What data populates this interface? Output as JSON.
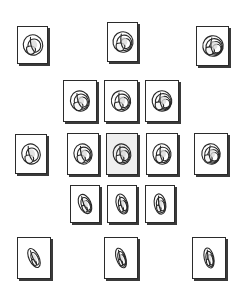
{
  "figure": {
    "type": "shape-matrix",
    "background_color": "#ffffff",
    "card_border_color": "#2b2b2b",
    "card_shadow_color": "#3a3a3a",
    "card_fill_color": "#ffffff",
    "selected_card_fill_color": "#efefef",
    "icon_stroke_color": "#262626",
    "icon_name": "spiral-shell-icon",
    "rows": 5,
    "columns": 5,
    "card_count": 15
  },
  "chart_data": {
    "type": "scatter",
    "xlabel": "",
    "ylabel": "",
    "grid": false,
    "legend": null,
    "cells": [
      {
        "id": "r1c1",
        "row": 1,
        "col": 1,
        "x": 17,
        "y": 26,
        "w": 31,
        "h": 38,
        "selected": false,
        "whorls": 2.2,
        "aperture": 0.55,
        "elongation": 0.95,
        "tilt": -18
      },
      {
        "id": "r1c3",
        "row": 1,
        "col": 3,
        "x": 107,
        "y": 22,
        "w": 31,
        "h": 40,
        "selected": false,
        "whorls": 3.4,
        "aperture": 0.5,
        "elongation": 0.98,
        "tilt": -12
      },
      {
        "id": "r1c5",
        "row": 1,
        "col": 5,
        "x": 196,
        "y": 26,
        "w": 33,
        "h": 40,
        "selected": false,
        "whorls": 3.8,
        "aperture": 0.46,
        "elongation": 1.0,
        "tilt": -8
      },
      {
        "id": "r2c2",
        "row": 2,
        "col": 2,
        "x": 63,
        "y": 80,
        "w": 34,
        "h": 42,
        "selected": false,
        "whorls": 2.6,
        "aperture": 0.6,
        "elongation": 0.92,
        "tilt": -22
      },
      {
        "id": "r2c3",
        "row": 2,
        "col": 3,
        "x": 104,
        "y": 80,
        "w": 34,
        "h": 42,
        "selected": false,
        "whorls": 3.2,
        "aperture": 0.52,
        "elongation": 0.94,
        "tilt": -14
      },
      {
        "id": "r2c4",
        "row": 2,
        "col": 4,
        "x": 145,
        "y": 80,
        "w": 34,
        "h": 42,
        "selected": false,
        "whorls": 3.6,
        "aperture": 0.48,
        "elongation": 0.96,
        "tilt": -10
      },
      {
        "id": "r3c1",
        "row": 3,
        "col": 1,
        "x": 15,
        "y": 134,
        "w": 32,
        "h": 40,
        "selected": false,
        "whorls": 2.4,
        "aperture": 0.56,
        "elongation": 0.9,
        "tilt": -20
      },
      {
        "id": "r3c2",
        "row": 3,
        "col": 2,
        "x": 67,
        "y": 133,
        "w": 32,
        "h": 42,
        "selected": false,
        "whorls": 2.8,
        "aperture": 0.54,
        "elongation": 0.88,
        "tilt": -18
      },
      {
        "id": "r3c3",
        "row": 3,
        "col": 3,
        "x": 106,
        "y": 133,
        "w": 32,
        "h": 42,
        "selected": true,
        "whorls": 3.0,
        "aperture": 0.5,
        "elongation": 0.86,
        "tilt": -14
      },
      {
        "id": "r3c4",
        "row": 3,
        "col": 4,
        "x": 146,
        "y": 133,
        "w": 32,
        "h": 42,
        "selected": false,
        "whorls": 3.4,
        "aperture": 0.46,
        "elongation": 0.88,
        "tilt": -10
      },
      {
        "id": "r3c5",
        "row": 3,
        "col": 5,
        "x": 194,
        "y": 133,
        "w": 34,
        "h": 42,
        "selected": false,
        "whorls": 3.7,
        "aperture": 0.44,
        "elongation": 0.9,
        "tilt": -6
      },
      {
        "id": "r4c2",
        "row": 4,
        "col": 2,
        "x": 70,
        "y": 185,
        "w": 30,
        "h": 38,
        "selected": false,
        "whorls": 2.5,
        "aperture": 0.4,
        "elongation": 0.58,
        "tilt": -24
      },
      {
        "id": "r4c3",
        "row": 4,
        "col": 3,
        "x": 107,
        "y": 185,
        "w": 30,
        "h": 38,
        "selected": false,
        "whorls": 2.9,
        "aperture": 0.36,
        "elongation": 0.55,
        "tilt": -16
      },
      {
        "id": "r4c4",
        "row": 4,
        "col": 4,
        "x": 145,
        "y": 185,
        "w": 30,
        "h": 38,
        "selected": false,
        "whorls": 3.2,
        "aperture": 0.34,
        "elongation": 0.56,
        "tilt": -10
      },
      {
        "id": "r5c1",
        "row": 5,
        "col": 1,
        "x": 17,
        "y": 237,
        "w": 34,
        "h": 42,
        "selected": false,
        "whorls": 2.3,
        "aperture": 0.34,
        "elongation": 0.48,
        "tilt": -26
      },
      {
        "id": "r5c3",
        "row": 5,
        "col": 3,
        "x": 104,
        "y": 237,
        "w": 34,
        "h": 42,
        "selected": false,
        "whorls": 2.8,
        "aperture": 0.32,
        "elongation": 0.46,
        "tilt": -18
      },
      {
        "id": "r5c5",
        "row": 5,
        "col": 5,
        "x": 192,
        "y": 237,
        "w": 34,
        "h": 42,
        "selected": false,
        "whorls": 3.1,
        "aperture": 0.3,
        "elongation": 0.47,
        "tilt": -12
      }
    ]
  }
}
